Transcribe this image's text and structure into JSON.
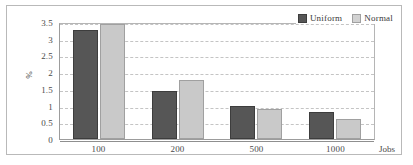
{
  "chart_data": {
    "type": "bar",
    "title": "",
    "xlabel": "Jobs",
    "ylabel": "%",
    "categories": [
      "100",
      "200",
      "500",
      "1000"
    ],
    "series": [
      {
        "name": "Uniform",
        "color": "#565656",
        "values": [
          3.27,
          1.45,
          1.0,
          0.82
        ]
      },
      {
        "name": "Normal",
        "color": "#c9c9c9",
        "values": [
          3.43,
          1.77,
          0.9,
          0.6
        ]
      }
    ],
    "ylim": [
      0,
      3.5
    ],
    "yticks": [
      "0",
      "0.5",
      "1",
      "1.5",
      "2",
      "2.5",
      "3",
      "3.5"
    ],
    "ytick_values": [
      0,
      0.5,
      1,
      1.5,
      2,
      2.5,
      3,
      3.5
    ],
    "grid": true,
    "legend_position": "top-right"
  },
  "legend": {
    "items": [
      {
        "label": "Uniform",
        "swatch": "uniform-swatch-icon"
      },
      {
        "label": "Normal",
        "swatch": "normal-swatch-icon"
      }
    ]
  }
}
